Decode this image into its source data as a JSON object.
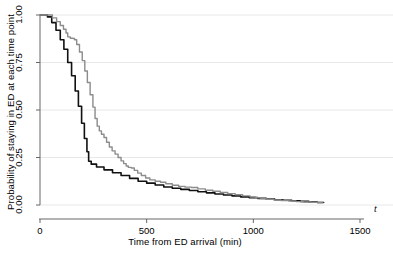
{
  "figure": {
    "background_color": "#ffffff",
    "t_symbol": "t"
  },
  "chart_data": {
    "type": "line",
    "title": "",
    "subtitle": "",
    "xlabel": "Time from ED arrival (min)",
    "ylabel": "Probability of staying in ED at each time point",
    "xlim": [
      0,
      1500
    ],
    "ylim": [
      0,
      1.0
    ],
    "xticks": [
      0,
      500,
      1000,
      1500
    ],
    "xtick_labels": [
      "0",
      "500",
      "1000",
      "1500"
    ],
    "yticks": [
      0.0,
      0.25,
      0.5,
      0.75,
      1.0
    ],
    "ytick_labels": [
      "0.00",
      "0.25",
      "0.50",
      "0.75",
      "1.00"
    ],
    "grid": true,
    "grid_axis": "y",
    "grid_color": "#e8e8e8",
    "legend": false,
    "legend_position": "none",
    "axis_color": "#666666",
    "annotations": [
      {
        "text": "t",
        "role": "x-axis-variable-symbol",
        "x": 1560,
        "y": 0.0
      }
    ],
    "series": [
      {
        "name": "Group 1",
        "color": "#111111",
        "line_width": 1.6,
        "step": true,
        "points": [
          [
            0,
            1.0
          ],
          [
            18,
            1.0
          ],
          [
            35,
            0.99
          ],
          [
            55,
            0.96
          ],
          [
            75,
            0.92
          ],
          [
            95,
            0.87
          ],
          [
            112,
            0.82
          ],
          [
            130,
            0.75
          ],
          [
            148,
            0.68
          ],
          [
            165,
            0.6
          ],
          [
            180,
            0.52
          ],
          [
            195,
            0.43
          ],
          [
            208,
            0.35
          ],
          [
            220,
            0.28
          ],
          [
            228,
            0.23
          ],
          [
            240,
            0.215
          ],
          [
            265,
            0.2
          ],
          [
            300,
            0.185
          ],
          [
            340,
            0.17
          ],
          [
            380,
            0.155
          ],
          [
            420,
            0.14
          ],
          [
            460,
            0.125
          ],
          [
            500,
            0.115
          ],
          [
            540,
            0.105
          ],
          [
            580,
            0.095
          ],
          [
            620,
            0.088
          ],
          [
            660,
            0.082
          ],
          [
            700,
            0.076
          ],
          [
            740,
            0.07
          ],
          [
            780,
            0.064
          ],
          [
            820,
            0.058
          ],
          [
            860,
            0.053
          ],
          [
            900,
            0.048
          ],
          [
            940,
            0.043
          ],
          [
            980,
            0.039
          ],
          [
            1020,
            0.035
          ],
          [
            1060,
            0.031
          ],
          [
            1100,
            0.028
          ],
          [
            1140,
            0.025
          ],
          [
            1180,
            0.022
          ],
          [
            1220,
            0.019
          ],
          [
            1260,
            0.016
          ],
          [
            1300,
            0.013
          ],
          [
            1330,
            0.012
          ]
        ]
      },
      {
        "name": "Group 2",
        "color": "#8c8c8c",
        "line_width": 1.4,
        "step": true,
        "points": [
          [
            0,
            1.0
          ],
          [
            20,
            1.0
          ],
          [
            40,
            1.0
          ],
          [
            58,
            0.985
          ],
          [
            78,
            0.965
          ],
          [
            95,
            0.945
          ],
          [
            110,
            0.925
          ],
          [
            122,
            0.905
          ],
          [
            130,
            0.885
          ],
          [
            142,
            0.878
          ],
          [
            155,
            0.876
          ],
          [
            162,
            0.87
          ],
          [
            172,
            0.845
          ],
          [
            185,
            0.805
          ],
          [
            198,
            0.76
          ],
          [
            210,
            0.705
          ],
          [
            222,
            0.645
          ],
          [
            235,
            0.58
          ],
          [
            248,
            0.515
          ],
          [
            258,
            0.455
          ],
          [
            268,
            0.415
          ],
          [
            278,
            0.39
          ],
          [
            288,
            0.372
          ],
          [
            300,
            0.355
          ],
          [
            312,
            0.33
          ],
          [
            325,
            0.305
          ],
          [
            338,
            0.285
          ],
          [
            352,
            0.268
          ],
          [
            366,
            0.25
          ],
          [
            380,
            0.232
          ],
          [
            392,
            0.218
          ],
          [
            404,
            0.205
          ],
          [
            414,
            0.198
          ],
          [
            428,
            0.195
          ],
          [
            442,
            0.182
          ],
          [
            458,
            0.168
          ],
          [
            475,
            0.155
          ],
          [
            495,
            0.142
          ],
          [
            515,
            0.132
          ],
          [
            540,
            0.125
          ],
          [
            565,
            0.12
          ],
          [
            590,
            0.112
          ],
          [
            620,
            0.104
          ],
          [
            650,
            0.098
          ],
          [
            680,
            0.094
          ],
          [
            710,
            0.092
          ],
          [
            740,
            0.085
          ],
          [
            775,
            0.078
          ],
          [
            810,
            0.072
          ],
          [
            845,
            0.066
          ],
          [
            880,
            0.06
          ],
          [
            915,
            0.054
          ],
          [
            950,
            0.048
          ],
          [
            985,
            0.042
          ],
          [
            1010,
            0.038
          ],
          [
            1035,
            0.034
          ],
          [
            1060,
            0.03
          ],
          [
            1095,
            0.027
          ],
          [
            1130,
            0.024
          ],
          [
            1165,
            0.021
          ],
          [
            1200,
            0.018
          ],
          [
            1235,
            0.016
          ],
          [
            1270,
            0.014
          ],
          [
            1300,
            0.013
          ],
          [
            1325,
            0.012
          ]
        ]
      }
    ]
  }
}
